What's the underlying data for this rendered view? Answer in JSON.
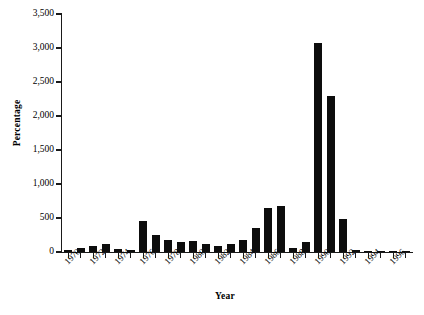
{
  "chart_data": {
    "type": "bar",
    "title": "",
    "xlabel": "Year",
    "ylabel": "Percentage",
    "ylim": [
      0,
      3500
    ],
    "yticks": [
      0,
      500,
      1000,
      1500,
      2000,
      2500,
      3000,
      3500
    ],
    "ytick_labels": [
      "0",
      "500",
      "1,000",
      "1,500",
      "2,000",
      "2,500",
      "3,000",
      "3,500"
    ],
    "xlim": [
      1969.5,
      1997.5
    ],
    "xtick_labels": [
      "1970",
      "1972",
      "1974",
      "1976",
      "1978",
      "1980",
      "1982",
      "1984",
      "1986",
      "1988",
      "1990",
      "1992",
      "1994",
      "1996"
    ],
    "xtick_years": [
      1970,
      1972,
      1974,
      1976,
      1978,
      1980,
      1982,
      1984,
      1986,
      1988,
      1990,
      1992,
      1994,
      1996
    ],
    "grid": false,
    "legend": false,
    "bar_color": "#0d0d0d",
    "categories": [
      1970,
      1971,
      1972,
      1973,
      1974,
      1975,
      1976,
      1977,
      1978,
      1979,
      1980,
      1981,
      1982,
      1983,
      1984,
      1985,
      1986,
      1987,
      1988,
      1989,
      1990,
      1991,
      1992,
      1993,
      1994,
      1995,
      1996,
      1997
    ],
    "values": [
      25,
      60,
      95,
      120,
      40,
      35,
      450,
      250,
      175,
      150,
      160,
      120,
      90,
      120,
      175,
      350,
      640,
      680,
      55,
      140,
      3075,
      2300,
      490,
      30,
      15,
      10,
      10,
      10
    ],
    "series": [
      {
        "name": "Percentage",
        "values": [
          25,
          60,
          95,
          120,
          40,
          35,
          450,
          250,
          175,
          150,
          160,
          120,
          90,
          120,
          175,
          350,
          640,
          680,
          55,
          140,
          3075,
          2300,
          490,
          30,
          15,
          10,
          10,
          10
        ]
      }
    ]
  }
}
